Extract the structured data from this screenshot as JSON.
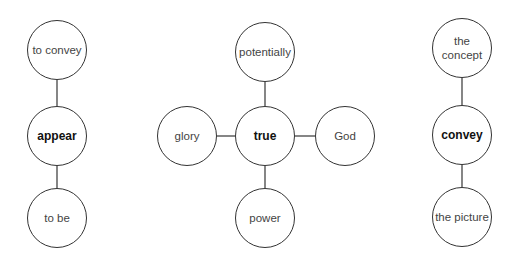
{
  "diagrams": [
    {
      "center": "appear",
      "neighbors": {
        "top": "to convey",
        "bottom": "to be"
      }
    },
    {
      "center": "true",
      "neighbors": {
        "top": "potentially",
        "bottom": "power",
        "left": "glory",
        "right": "God"
      }
    },
    {
      "center": "convey",
      "neighbors": {
        "top": "the concept",
        "bottom": "the picture"
      }
    }
  ],
  "colors": {
    "stroke": "#333333",
    "core_text": "#111111",
    "text": "#444444",
    "background": "#ffffff"
  }
}
